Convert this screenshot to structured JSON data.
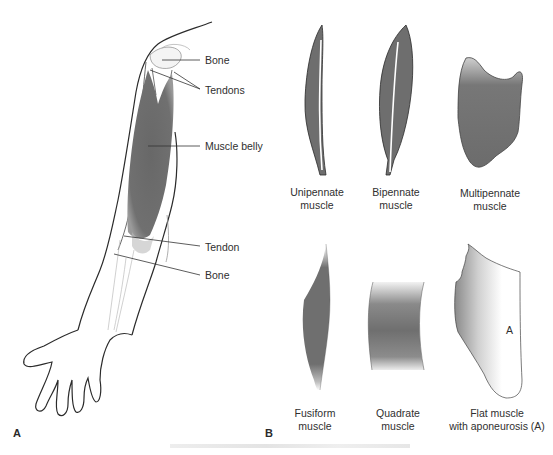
{
  "figure": {
    "panel_a": {
      "letter": "A",
      "labels": {
        "bone_top": "Bone",
        "tendons": "Tendons",
        "muscle_belly": "Muscle belly",
        "tendon": "Tendon",
        "bone_bottom": "Bone"
      }
    },
    "panel_b": {
      "letter": "B",
      "muscles": [
        {
          "name": "Unipennate muscle",
          "caption": "Unipennate\nmuscle"
        },
        {
          "name": "Bipennate muscle",
          "caption": "Bipennate\nmuscle"
        },
        {
          "name": "Multipennate muscle",
          "caption": "Multipennate\nmuscle"
        },
        {
          "name": "Fusiform muscle",
          "caption": "Fusiform\nmuscle"
        },
        {
          "name": "Quadrate muscle",
          "caption": "Quadrate\nmuscle"
        },
        {
          "name": "Flat muscle with aponeurosis",
          "caption": "Flat muscle\nwith aponeurosis (A)"
        }
      ],
      "aponeurosis_marker": "A"
    },
    "colors": {
      "muscle": "#6e6e6e",
      "outline": "#2b2b2b",
      "background": "#ffffff"
    }
  }
}
